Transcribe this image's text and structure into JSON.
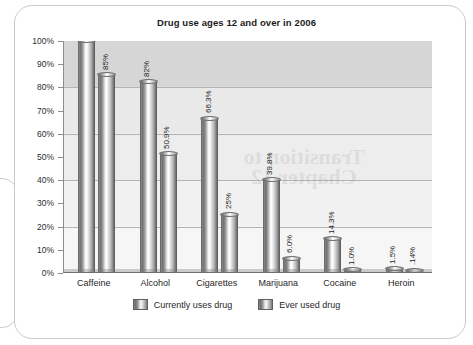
{
  "chart_data": {
    "type": "bar",
    "title": "Drug use ages 12 and over in 2006",
    "xlabel": "",
    "ylabel": "",
    "ylim": [
      0,
      100
    ],
    "ytick_labels": [
      "100%",
      "90%",
      "80%",
      "70%",
      "60%",
      "50%",
      "40%",
      "30%",
      "20%",
      "10%",
      "0%"
    ],
    "ytick_values": [
      100,
      90,
      80,
      70,
      60,
      50,
      40,
      30,
      20,
      10,
      0
    ],
    "grid": "horizontal gridlines at 20%, 40%, 60%, 80%",
    "legend_position": "bottom-center",
    "categories": [
      "Caffeine",
      "Alcohol",
      "Cigarettes",
      "Marijuana",
      "Cocaine",
      "Heroin"
    ],
    "series": [
      {
        "name": "Currently uses drug",
        "values": [
          100,
          82,
          66.3,
          39.8,
          14.3,
          1.5
        ],
        "point_labels": [
          "",
          "82%",
          "66.3%",
          "39.8%",
          "14.3%",
          "1.5%"
        ]
      },
      {
        "name": "Ever used drug",
        "values": [
          85,
          50.9,
          25,
          6.0,
          1.0,
          0.14
        ],
        "point_labels": [
          "85%",
          "50.9%",
          "25%",
          "6.0%",
          "1.0%",
          ".14%"
        ]
      }
    ],
    "annotations": [
      "Bars are drawn as 3D grey cylinders; data labels are rotated 90 degrees"
    ],
    "colors": {
      "bar_light": "#ffffff",
      "bar_mid": "#9a9a9a",
      "bar_dark": "#6a6a6a",
      "plot_background_top": "#d6d6d6",
      "plot_background_bottom": "#f6f6f6",
      "gridline": "#b3b3b3",
      "text": "#1f1f1f",
      "card_border": "#c9c9c9"
    }
  },
  "watermark": {
    "text": "bleed-through"
  }
}
